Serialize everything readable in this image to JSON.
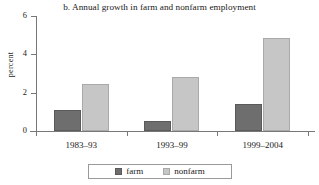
{
  "chart_data": {
    "type": "bar",
    "title": "b. Annual growth in farm and nonfarm employment",
    "xlabel": "",
    "ylabel": "percent",
    "categories": [
      "1983–93",
      "1993–99",
      "1999–2004"
    ],
    "series": [
      {
        "name": "farm",
        "color": "#6e6e6e",
        "values": [
          1.1,
          0.5,
          1.4
        ]
      },
      {
        "name": "nonfarm",
        "color": "#c6c6c6",
        "values": [
          2.45,
          2.8,
          4.85
        ]
      }
    ],
    "ylim": [
      0,
      6
    ],
    "yticks": [
      0,
      2,
      4,
      6
    ],
    "ytick_labels": [
      "0",
      "2",
      "4",
      "6"
    ],
    "grid": false,
    "legend_position": "bottom"
  },
  "legend": {
    "entries": [
      {
        "label": "farm"
      },
      {
        "label": "nonfarm"
      }
    ]
  }
}
